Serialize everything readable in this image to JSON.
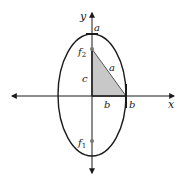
{
  "diagram": {
    "colors": {
      "stroke": "#1a1a1a",
      "triangle_fill": "#c8c8c8",
      "triangle_edge": "#555555",
      "focus": "#777777"
    },
    "axes": {
      "x_label": "x",
      "y_label": "y"
    },
    "labels": {
      "top_a": "a",
      "hyp_a": "a",
      "c": "c",
      "inner_b": "b",
      "outer_b": "b"
    },
    "foci": [
      {
        "name": "f",
        "sub": "2"
      },
      {
        "name": "f",
        "sub": "1"
      }
    ]
  }
}
